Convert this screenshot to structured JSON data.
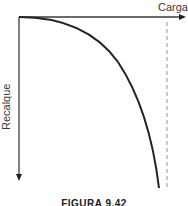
{
  "diagram": {
    "x_axis_label": "Carga",
    "y_axis_label": "Recalque",
    "caption": "FIGURA 9.42",
    "colors": {
      "axis": "#3a3a3a",
      "curve": "#222222",
      "dashed_line": "#888888",
      "background": "#ffffff"
    },
    "elements": [
      {
        "name": "x-axis",
        "type": "arrow",
        "direction": "right"
      },
      {
        "name": "y-axis",
        "type": "arrow",
        "direction": "down"
      },
      {
        "name": "load-settlement-curve",
        "type": "curve",
        "shape": "concave-down, steepening toward vertical asymptote"
      },
      {
        "name": "ultimate-load-asymptote",
        "type": "dashed-vertical-line"
      }
    ]
  }
}
